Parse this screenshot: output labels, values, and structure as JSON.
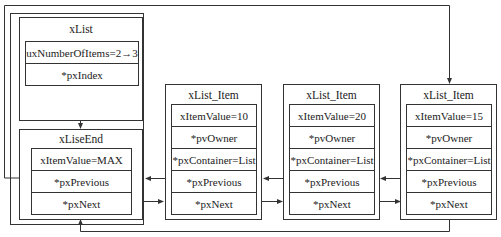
{
  "list": {
    "title": "xList",
    "fields": [
      "uxNumberOfItems=2→3",
      "*pxIndex"
    ]
  },
  "list_end": {
    "title": "xLiseEnd",
    "fields": [
      "xItemValue=MAX",
      "*pxPrevious",
      "*pxNext"
    ]
  },
  "items": [
    {
      "title": "xList_Item",
      "fields": [
        "xItemValue=10",
        "*pvOwner",
        "*pxContainer=List",
        "*pxPrevious",
        "*pxNext"
      ]
    },
    {
      "title": "xList_Item",
      "fields": [
        "xItemValue=20",
        "*pvOwner",
        "*pxContainer=List",
        "*pxPrevious",
        "*pxNext"
      ]
    },
    {
      "title": "xList_Item",
      "fields": [
        "xItemValue=15",
        "*pvOwner",
        "*pxContainer=List",
        "*pxPrevious",
        "*pxNext"
      ]
    }
  ],
  "colors": {
    "line": "#333333",
    "background": "#ffffff"
  }
}
